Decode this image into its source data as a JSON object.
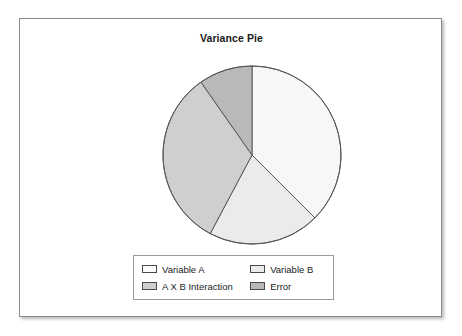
{
  "panel": {
    "background": "#ffffff",
    "border_color": "#8c8c8c"
  },
  "chart_data": {
    "type": "pie",
    "title": "Variance Pie",
    "xlabel": "",
    "ylabel": "",
    "legend_position": "bottom",
    "grid": false,
    "categories": [
      "Variable A",
      "Variable B",
      "A X B Interaction",
      "Error"
    ],
    "values": [
      37.5,
      20.3,
      32.5,
      9.7
    ],
    "units": "percent",
    "start_angle_deg": 0,
    "direction": "clockwise",
    "slices": [
      {
        "label": "Variable A",
        "value": 37.5,
        "start_angle_deg": 0,
        "end_angle_deg": 135,
        "color": "#f7f7f7"
      },
      {
        "label": "Variable B",
        "value": 20.3,
        "start_angle_deg": 135,
        "end_angle_deg": 208,
        "color": "#ebebeb"
      },
      {
        "label": "A X B Interaction",
        "value": 32.5,
        "start_angle_deg": 208,
        "end_angle_deg": 325,
        "color": "#cfcfcf"
      },
      {
        "label": "Error",
        "value": 9.7,
        "start_angle_deg": 325,
        "end_angle_deg": 360,
        "color": "#b9b9b9"
      }
    ],
    "slice_border_color": "#595959",
    "legend_entries": [
      {
        "label": "Variable A",
        "color": "#fbfbfb"
      },
      {
        "label": "Variable B",
        "color": "#ebebeb"
      },
      {
        "label": "A X B Interaction",
        "color": "#cfcfcf"
      },
      {
        "label": "Error",
        "color": "#b9b9b9"
      }
    ]
  }
}
